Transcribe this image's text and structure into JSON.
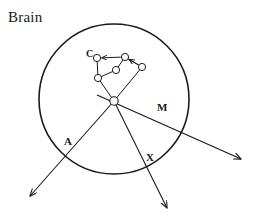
{
  "figure": {
    "title": "Brain",
    "background_color": "#ffffff",
    "ink_color": "#1a1a1a"
  },
  "boundary": {
    "name": "brain-boundary-circle",
    "shape": "circle",
    "center_x": 114,
    "center_y": 99,
    "radius": 75,
    "stroke_color": "#1a1a1a",
    "stroke_width": 1.6
  },
  "hub": {
    "label": "",
    "center_x": 114,
    "center_y": 101,
    "radius": 4.2
  },
  "cluster": {
    "label": "C",
    "label_x": 86,
    "label_y": 49,
    "node_radius": 3.6,
    "nodes": [
      {
        "id": "c1",
        "x": 97,
        "y": 58
      },
      {
        "id": "c2",
        "x": 125,
        "y": 57
      },
      {
        "id": "c3",
        "x": 142,
        "y": 67
      },
      {
        "id": "c4",
        "x": 116,
        "y": 70
      },
      {
        "id": "c5",
        "x": 98,
        "y": 78
      },
      {
        "id": "c6",
        "x": 114,
        "y": 101
      }
    ],
    "edges": [
      {
        "from": "c1",
        "to": "c5"
      },
      {
        "from": "c2",
        "to": "c3"
      },
      {
        "from": "c2",
        "to": "c4"
      },
      {
        "from": "c4",
        "to": "c5"
      },
      {
        "from": "c3",
        "to": "c6"
      },
      {
        "from": "c5",
        "to": "c6"
      }
    ],
    "arrows": [
      {
        "from": "c2",
        "to": "c1",
        "head": "c1"
      },
      {
        "from": "c3",
        "to": "c2",
        "head": "c2"
      }
    ]
  },
  "rays": [
    {
      "id": "ray-a",
      "label": "A",
      "label_x": 64,
      "label_y": 136,
      "x1": 114,
      "y1": 101,
      "x2": 30,
      "y2": 196
    },
    {
      "id": "ray-x",
      "label": "X",
      "label_x": 146,
      "label_y": 152,
      "x1": 114,
      "y1": 101,
      "x2": 167,
      "y2": 208
    },
    {
      "id": "ray-m",
      "label": "M",
      "label_x": 157,
      "label_y": 102,
      "x1": 97,
      "y1": 95,
      "x2": 241,
      "y2": 159
    }
  ]
}
